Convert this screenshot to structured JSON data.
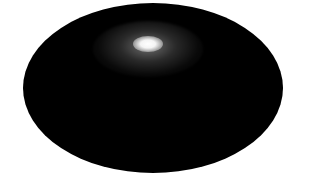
{
  "image": {
    "description": "All-sky map (elliptical projection) with a bright diffuse source near upper center",
    "background_color": "#ffffff",
    "map_color": "#000000",
    "source": {
      "core_color": "#ffffff",
      "halo_color": "#a0a0a0"
    }
  }
}
